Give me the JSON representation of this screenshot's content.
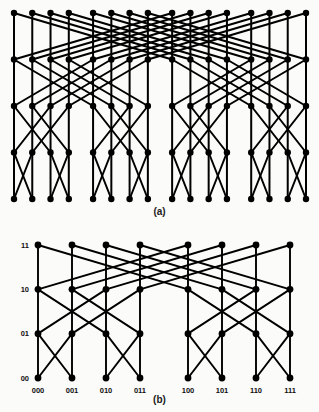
{
  "figure": {
    "panels": [
      {
        "id": "a",
        "caption": "(a)",
        "type": "butterfly-network",
        "columns": 16,
        "levels": 5,
        "node_color": "#000000",
        "edge_color": "#000000",
        "show_labels": false,
        "group_gap_every": 4
      },
      {
        "id": "b",
        "caption": "(b)",
        "type": "butterfly-network",
        "columns": 8,
        "levels": 4,
        "node_color": "#000000",
        "edge_color": "#000000",
        "show_labels": true,
        "group_gap_every": 4,
        "row_labels": [
          "00",
          "01",
          "10",
          "11"
        ],
        "column_labels": [
          "000",
          "001",
          "010",
          "011",
          "100",
          "101",
          "110",
          "111"
        ]
      }
    ]
  },
  "chart_data": {
    "type": "diagram",
    "title": "",
    "subtitle": "",
    "panels": [
      {
        "name": "(a)",
        "graph": "butterfly",
        "dimension": 4,
        "num_columns": 16,
        "num_rows": 5,
        "num_nodes": 80,
        "row_labels": [],
        "column_labels": [],
        "edge_rule": "level i connects column c to column c XOR 2^i, plus vertical edges"
      },
      {
        "name": "(b)",
        "graph": "butterfly",
        "dimension": 3,
        "num_columns": 8,
        "num_rows": 4,
        "num_nodes": 32,
        "row_labels": [
          "11",
          "10",
          "01",
          "00"
        ],
        "column_labels": [
          "000",
          "001",
          "010",
          "011",
          "100",
          "101",
          "110",
          "111"
        ],
        "edge_rule": "level i connects column c to column c XOR 2^i, plus vertical edges"
      }
    ]
  }
}
